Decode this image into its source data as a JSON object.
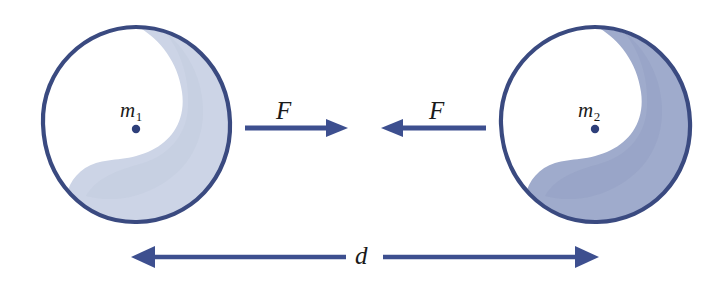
{
  "figure": {
    "background_color": "#ffffff"
  },
  "colors": {
    "outline_dark": "#3a4a80",
    "rim_dark": "#2e3f7a",
    "sphere_left_shade": "#ccd4e6",
    "sphere_right_shade": "#9fabcc",
    "sphere_highlight": "#ffffff",
    "arrow": "#3d4f8f",
    "center_dot": "#2e3f7a",
    "text": "#1a1a1a"
  },
  "bodies": [
    {
      "name": "left-mass",
      "mass_label": "m",
      "mass_subscript": "1",
      "center_dot": true,
      "shade_tone": "light"
    },
    {
      "name": "right-mass",
      "mass_label": "m",
      "mass_subscript": "2",
      "center_dot": true,
      "shade_tone": "dark"
    }
  ],
  "forces": [
    {
      "name": "force-on-left-mass",
      "label": "F",
      "direction": "right",
      "description": "attractive force pulling left mass toward right mass"
    },
    {
      "name": "force-on-right-mass",
      "label": "F",
      "direction": "left",
      "description": "attractive force pulling right mass toward left mass"
    }
  ],
  "distance": {
    "name": "separation",
    "label": "d",
    "description": "center-to-center separation between the two masses",
    "arrow_style": "double-headed"
  }
}
